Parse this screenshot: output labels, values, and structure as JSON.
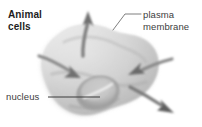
{
  "figure": {
    "background_color": "#ffffff",
    "style": "grayscale textbook illustration"
  },
  "labels": {
    "animal_cells": {
      "line1": "Animal",
      "line2": "cells",
      "color": "#1d1d1d",
      "weight": "bold"
    },
    "plasma_membrane": {
      "line1": "plasma",
      "line2": "membrane",
      "color": "#3d3d3d",
      "weight": "normal"
    },
    "nucleus": {
      "text": "nucleus",
      "color": "#3d3d3d",
      "weight": "normal"
    }
  },
  "leader_lines": [
    {
      "name": "plasma-membrane-leader",
      "from_label": "plasma membrane",
      "to_structure": "plasma membrane edge",
      "color": "#6b6b6b"
    },
    {
      "name": "nucleus-leader",
      "from_label": "nucleus",
      "to_structure": "nucleus",
      "color": "#3a3a3a"
    }
  ],
  "structures": {
    "cell_body": {
      "name": "animal cell",
      "fill_light": "#e2e2e2",
      "fill_mid": "#c9c9c9",
      "fill_dark": "#a9a9a9"
    },
    "nucleus": {
      "name": "nucleus",
      "fill_light": "#cfcfcf",
      "fill_dark": "#8f8f8f"
    }
  },
  "arrows": [
    {
      "name": "arrow-out-top",
      "direction": "outward",
      "orientation": "up",
      "color": "#7a7a7a"
    },
    {
      "name": "arrow-in-left",
      "direction": "inward",
      "orientation": "right",
      "color": "#7a7a7a"
    },
    {
      "name": "arrow-in-right",
      "direction": "inward",
      "orientation": "left",
      "color": "#6f6f6f"
    },
    {
      "name": "arrow-out-bottom-right",
      "direction": "outward",
      "orientation": "down-right",
      "color": "#5e5e5e"
    }
  ]
}
